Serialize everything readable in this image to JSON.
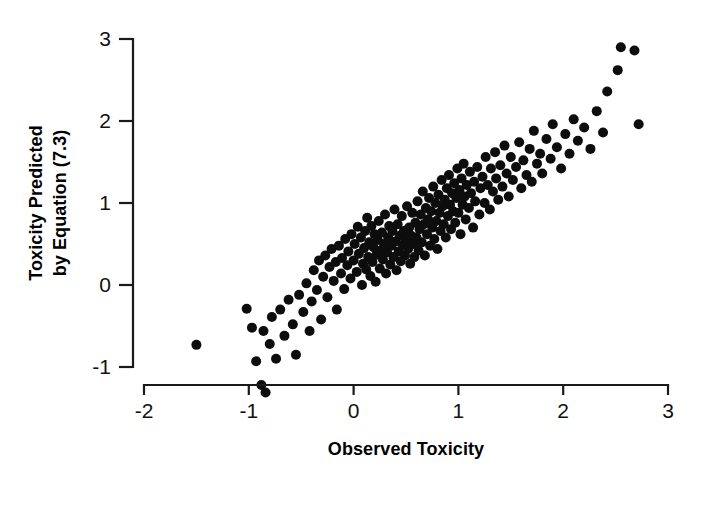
{
  "figure": {
    "background_color": "#ffffff",
    "point_color": "#0d0d0d",
    "axis_color": "#1a1a1a"
  },
  "axes": {
    "x_title": "Observed Toxicity",
    "y_title_line1": "Toxicity Predicted",
    "y_title_line2": "by Equation (7.3)",
    "x_ticks": [
      "-2",
      "-1",
      "0",
      "1",
      "2",
      "3"
    ],
    "y_ticks": [
      "3",
      "2",
      "1",
      "0",
      "-1"
    ]
  },
  "chart_data": {
    "type": "scatter",
    "title": "",
    "xlabel": "Observed Toxicity",
    "ylabel": "Toxicity Predicted by Equation (7.3)",
    "xlim": [
      -2,
      3
    ],
    "ylim": [
      -1.4,
      3.1
    ],
    "xticks": [
      -2,
      -1,
      0,
      1,
      2,
      3
    ],
    "yticks": [
      -1,
      0,
      1,
      2,
      3
    ],
    "grid": false,
    "legend": null,
    "marker": "filled-circle",
    "marker_size_px": 10,
    "n_points": 196,
    "points": [
      [
        -1.5,
        -0.73
      ],
      [
        -1.02,
        -0.29
      ],
      [
        -0.97,
        -0.52
      ],
      [
        -0.93,
        -0.93
      ],
      [
        -0.88,
        -1.22
      ],
      [
        -0.86,
        -0.56
      ],
      [
        -0.84,
        -1.31
      ],
      [
        -0.8,
        -0.72
      ],
      [
        -0.78,
        -0.39
      ],
      [
        -0.74,
        -0.9
      ],
      [
        -0.7,
        -0.3
      ],
      [
        -0.66,
        -0.62
      ],
      [
        -0.62,
        -0.18
      ],
      [
        -0.58,
        -0.48
      ],
      [
        -0.55,
        -0.85
      ],
      [
        -0.52,
        -0.12
      ],
      [
        -0.48,
        -0.33
      ],
      [
        -0.45,
        0.02
      ],
      [
        -0.42,
        -0.56
      ],
      [
        -0.4,
        -0.2
      ],
      [
        -0.38,
        0.18
      ],
      [
        -0.35,
        -0.06
      ],
      [
        -0.33,
        0.3
      ],
      [
        -0.31,
        -0.42
      ],
      [
        -0.29,
        0.1
      ],
      [
        -0.27,
        0.36
      ],
      [
        -0.25,
        -0.15
      ],
      [
        -0.23,
        0.22
      ],
      [
        -0.21,
        0.44
      ],
      [
        -0.19,
        0.05
      ],
      [
        -0.17,
        0.28
      ],
      [
        -0.16,
        -0.3
      ],
      [
        -0.14,
        0.48
      ],
      [
        -0.12,
        0.14
      ],
      [
        -0.11,
        0.33
      ],
      [
        -0.09,
        -0.05
      ],
      [
        -0.08,
        0.56
      ],
      [
        -0.06,
        0.24
      ],
      [
        -0.05,
        0.41
      ],
      [
        -0.03,
        0.08
      ],
      [
        -0.02,
        0.62
      ],
      [
        0.0,
        0.3
      ],
      [
        0.01,
        0.5
      ],
      [
        0.03,
        0.16
      ],
      [
        0.04,
        0.71
      ],
      [
        0.05,
        0.38
      ],
      [
        0.07,
        0.58
      ],
      [
        0.08,
        0.0
      ],
      [
        0.09,
        0.26
      ],
      [
        0.1,
        0.45
      ],
      [
        0.11,
        0.66
      ],
      [
        0.12,
        0.19
      ],
      [
        0.13,
        0.82
      ],
      [
        0.14,
        0.34
      ],
      [
        0.15,
        0.52
      ],
      [
        0.16,
        0.11
      ],
      [
        0.17,
        0.72
      ],
      [
        0.18,
        0.28
      ],
      [
        0.19,
        0.46
      ],
      [
        0.2,
        0.62
      ],
      [
        0.21,
        0.04
      ],
      [
        0.22,
        0.37
      ],
      [
        0.23,
        0.55
      ],
      [
        0.24,
        0.78
      ],
      [
        0.25,
        0.2
      ],
      [
        0.26,
        0.42
      ],
      [
        0.27,
        0.64
      ],
      [
        0.28,
        0.31
      ],
      [
        0.29,
        0.5
      ],
      [
        0.3,
        0.86
      ],
      [
        0.31,
        0.14
      ],
      [
        0.32,
        0.4
      ],
      [
        0.33,
        0.58
      ],
      [
        0.34,
        0.72
      ],
      [
        0.35,
        0.25
      ],
      [
        0.36,
        0.48
      ],
      [
        0.37,
        0.66
      ],
      [
        0.38,
        0.34
      ],
      [
        0.39,
        0.92
      ],
      [
        0.4,
        0.53
      ],
      [
        0.41,
        0.18
      ],
      [
        0.42,
        0.74
      ],
      [
        0.43,
        0.41
      ],
      [
        0.44,
        0.6
      ],
      [
        0.45,
        0.29
      ],
      [
        0.46,
        0.84
      ],
      [
        0.47,
        0.49
      ],
      [
        0.48,
        0.66
      ],
      [
        0.49,
        0.36
      ],
      [
        0.5,
        0.55
      ],
      [
        0.51,
        0.96
      ],
      [
        0.52,
        0.44
      ],
      [
        0.53,
        0.7
      ],
      [
        0.54,
        0.26
      ],
      [
        0.55,
        0.6
      ],
      [
        0.56,
        0.88
      ],
      [
        0.57,
        0.5
      ],
      [
        0.58,
        0.34
      ],
      [
        0.59,
        0.76
      ],
      [
        0.6,
        0.58
      ],
      [
        0.61,
        1.02
      ],
      [
        0.62,
        0.42
      ],
      [
        0.63,
        0.68
      ],
      [
        0.64,
        0.86
      ],
      [
        0.65,
        0.52
      ],
      [
        0.66,
        1.14
      ],
      [
        0.67,
        0.74
      ],
      [
        0.68,
        0.36
      ],
      [
        0.69,
        0.94
      ],
      [
        0.7,
        0.62
      ],
      [
        0.71,
        0.8
      ],
      [
        0.72,
        1.06
      ],
      [
        0.73,
        0.48
      ],
      [
        0.74,
        0.9
      ],
      [
        0.75,
        0.7
      ],
      [
        0.76,
        1.2
      ],
      [
        0.77,
        0.56
      ],
      [
        0.78,
        1.0
      ],
      [
        0.79,
        0.78
      ],
      [
        0.8,
        0.44
      ],
      [
        0.81,
        1.1
      ],
      [
        0.82,
        0.88
      ],
      [
        0.83,
        0.66
      ],
      [
        0.84,
        1.28
      ],
      [
        0.85,
        0.96
      ],
      [
        0.86,
        0.74
      ],
      [
        0.87,
        1.04
      ],
      [
        0.88,
        0.58
      ],
      [
        0.89,
        1.18
      ],
      [
        0.9,
        0.84
      ],
      [
        0.91,
        1.34
      ],
      [
        0.92,
        0.98
      ],
      [
        0.93,
        0.68
      ],
      [
        0.94,
        1.12
      ],
      [
        0.95,
        0.9
      ],
      [
        0.96,
        1.24
      ],
      [
        0.97,
        0.76
      ],
      [
        0.98,
        1.06
      ],
      [
        0.99,
        1.42
      ],
      [
        1.0,
        0.88
      ],
      [
        1.01,
        1.16
      ],
      [
        1.02,
        0.62
      ],
      [
        1.03,
        1.3
      ],
      [
        1.04,
        0.98
      ],
      [
        1.05,
        1.48
      ],
      [
        1.06,
        1.08
      ],
      [
        1.07,
        0.8
      ],
      [
        1.08,
        1.22
      ],
      [
        1.1,
        0.94
      ],
      [
        1.11,
        1.38
      ],
      [
        1.12,
        1.12
      ],
      [
        1.14,
        0.7
      ],
      [
        1.15,
        1.26
      ],
      [
        1.16,
        1.02
      ],
      [
        1.18,
        1.44
      ],
      [
        1.2,
        0.86
      ],
      [
        1.21,
        1.18
      ],
      [
        1.23,
        1.32
      ],
      [
        1.25,
        1.0
      ],
      [
        1.26,
        1.56
      ],
      [
        1.28,
        1.22
      ],
      [
        1.3,
        0.92
      ],
      [
        1.31,
        1.42
      ],
      [
        1.33,
        1.14
      ],
      [
        1.35,
        1.62
      ],
      [
        1.36,
        1.3
      ],
      [
        1.38,
        1.04
      ],
      [
        1.4,
        1.46
      ],
      [
        1.42,
        1.2
      ],
      [
        1.44,
        1.7
      ],
      [
        1.46,
        1.36
      ],
      [
        1.48,
        1.08
      ],
      [
        1.5,
        1.56
      ],
      [
        1.52,
        1.28
      ],
      [
        1.55,
        1.44
      ],
      [
        1.58,
        1.74
      ],
      [
        1.6,
        1.18
      ],
      [
        1.62,
        1.52
      ],
      [
        1.65,
        1.34
      ],
      [
        1.68,
        1.66
      ],
      [
        1.7,
        1.26
      ],
      [
        1.72,
        1.88
      ],
      [
        1.75,
        1.48
      ],
      [
        1.78,
        1.6
      ],
      [
        1.8,
        1.36
      ],
      [
        1.84,
        1.78
      ],
      [
        1.88,
        1.54
      ],
      [
        1.9,
        1.96
      ],
      [
        1.94,
        1.68
      ],
      [
        1.98,
        1.42
      ],
      [
        2.02,
        1.84
      ],
      [
        2.06,
        1.6
      ],
      [
        2.1,
        2.02
      ],
      [
        2.14,
        1.76
      ],
      [
        2.2,
        1.92
      ],
      [
        2.26,
        1.66
      ],
      [
        2.32,
        2.12
      ],
      [
        2.38,
        1.86
      ],
      [
        2.42,
        2.36
      ],
      [
        2.52,
        2.62
      ],
      [
        2.55,
        2.9
      ],
      [
        2.68,
        2.86
      ],
      [
        2.72,
        1.96
      ]
    ]
  }
}
